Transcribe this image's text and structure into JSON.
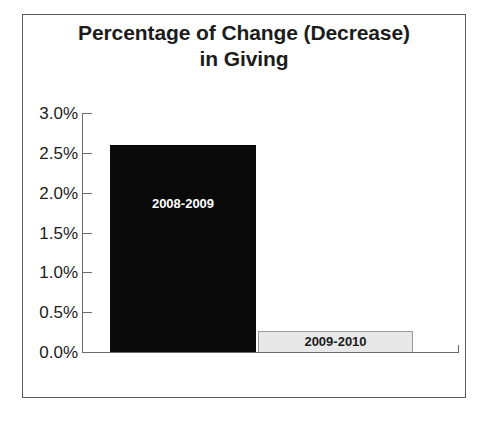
{
  "chart_data": {
    "type": "bar",
    "title": "Percentage of Change (Decrease) in Giving",
    "title_lines": [
      "Percentage of Change (Decrease)",
      "in Giving"
    ],
    "xlabel": "",
    "ylabel": "",
    "categories": [
      "2008-2009",
      "2009-2010"
    ],
    "values": [
      2.6,
      0.26
    ],
    "value_unit": "%",
    "ylim": [
      0.0,
      3.0
    ],
    "ytick_values": [
      0.0,
      0.5,
      1.0,
      1.5,
      2.0,
      2.5,
      3.0
    ],
    "ytick_labels": [
      "0.0%",
      "0.5%",
      "1.0%",
      "1.5%",
      "2.0%",
      "2.5%",
      "3.0%"
    ],
    "grid": false,
    "legend": false,
    "legend_position": "none",
    "bar_labels_inside": true,
    "series": [
      {
        "name": "Percentage of Change (Decrease) in Giving",
        "values": [
          2.6,
          0.26
        ]
      }
    ],
    "bars": [
      {
        "label": "2008-2009",
        "value": 2.6,
        "fill": "#0a0a0a",
        "label_color": "#ffffff"
      },
      {
        "label": "2009-2010",
        "value": 0.26,
        "fill": "#e8e8e8",
        "label_color": "#1c1c1c"
      }
    ],
    "colors": {
      "frame": "#5a5a5a",
      "axis": "#6b6b6b",
      "text": "#1c1c1c",
      "bar_one": "#0a0a0a",
      "bar_two": "#e8e8e8",
      "bar_two_border": "#9a9a9a",
      "background": "#ffffff"
    }
  }
}
